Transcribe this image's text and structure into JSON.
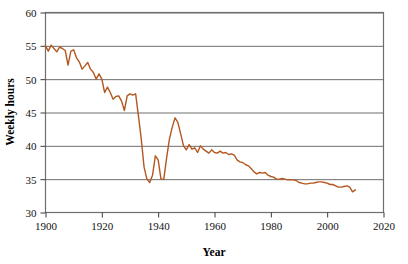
{
  "chart_data": {
    "type": "line",
    "title": "",
    "xlabel": "Year",
    "ylabel": "Weekly hours",
    "xlim": [
      1900,
      2020
    ],
    "ylim": [
      30,
      60
    ],
    "xticks": [
      1900,
      1920,
      1940,
      1960,
      1980,
      2000,
      2020
    ],
    "yticks": [
      30,
      35,
      40,
      45,
      50,
      55,
      60
    ],
    "grid": "horizontal",
    "legend": "none",
    "line_color": "#B4571F",
    "series": [
      {
        "name": "Weekly hours",
        "x": [
          1900,
          1901,
          1902,
          1903,
          1904,
          1905,
          1906,
          1907,
          1908,
          1909,
          1910,
          1911,
          1912,
          1913,
          1914,
          1915,
          1916,
          1917,
          1918,
          1919,
          1920,
          1921,
          1922,
          1923,
          1924,
          1925,
          1926,
          1927,
          1928,
          1929,
          1930,
          1931,
          1932,
          1933,
          1934,
          1935,
          1936,
          1937,
          1938,
          1939,
          1940,
          1941,
          1942,
          1943,
          1944,
          1945,
          1946,
          1947,
          1948,
          1949,
          1950,
          1951,
          1952,
          1953,
          1954,
          1955,
          1956,
          1957,
          1958,
          1959,
          1960,
          1961,
          1962,
          1963,
          1964,
          1965,
          1966,
          1967,
          1968,
          1969,
          1970,
          1971,
          1972,
          1973,
          1974,
          1975,
          1976,
          1977,
          1978,
          1979,
          1980,
          1981,
          1982,
          1983,
          1984,
          1985,
          1986,
          1987,
          1988,
          1989,
          1990,
          1991,
          1992,
          1993,
          1994,
          1995,
          1996,
          1997,
          1998,
          1999,
          2000,
          2001,
          2002,
          2003,
          2004,
          2005,
          2006,
          2007,
          2008,
          2009,
          2010
        ],
        "values": [
          55.0,
          54.2,
          55.1,
          54.6,
          54.1,
          54.8,
          54.6,
          54.3,
          52.1,
          54.2,
          54.4,
          53.2,
          52.6,
          51.5,
          52.0,
          52.5,
          51.5,
          51.0,
          50.0,
          50.8,
          50.0,
          48.0,
          48.8,
          48.0,
          47.0,
          47.4,
          47.5,
          46.7,
          45.3,
          47.5,
          47.8,
          47.6,
          47.8,
          44.5,
          41.0,
          36.8,
          35.0,
          34.5,
          35.6,
          38.5,
          37.9,
          35.0,
          35.0,
          38.2,
          41.0,
          42.8,
          44.2,
          43.5,
          41.8,
          40.0,
          39.4,
          40.2,
          39.5,
          39.7,
          39.0,
          40.0,
          39.5,
          39.2,
          38.9,
          39.4,
          39.0,
          38.9,
          39.2,
          38.9,
          39.0,
          38.7,
          38.8,
          38.6,
          37.9,
          37.6,
          37.5,
          37.2,
          37.0,
          36.6,
          36.1,
          35.8,
          36.0,
          35.9,
          36.0,
          35.6,
          35.4,
          35.3,
          35.0,
          35.0,
          35.1,
          35.0,
          34.9,
          34.9,
          34.9,
          34.8,
          34.5,
          34.4,
          34.3,
          34.3,
          34.4,
          34.4,
          34.5,
          34.6,
          34.6,
          34.5,
          34.4,
          34.2,
          34.2,
          34.0,
          33.8,
          33.8,
          33.9,
          34.0,
          33.8,
          33.1,
          33.4
        ]
      }
    ]
  }
}
